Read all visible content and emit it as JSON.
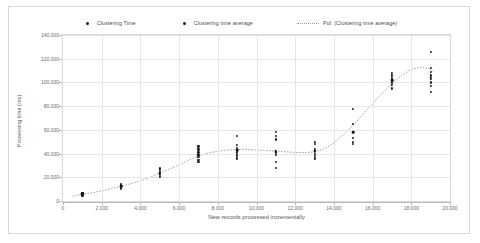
{
  "chart_data": {
    "type": "scatter",
    "title": "",
    "xlabel": "New records processed incrementally",
    "ylabel": "Processing time (ms)",
    "xlim": [
      0,
      20000
    ],
    "ylim": [
      0,
      140000
    ],
    "xticks": [
      0,
      2000,
      4000,
      6000,
      8000,
      10000,
      12000,
      14000,
      16000,
      18000,
      20000
    ],
    "xtick_labels": [
      "0",
      "2.000",
      "4.000",
      "6.000",
      "8.000",
      "10.000",
      "12.000",
      "14.000",
      "16.000",
      "18.000",
      "20.000"
    ],
    "yticks": [
      0,
      20000,
      40000,
      60000,
      80000,
      100000,
      120000,
      140000
    ],
    "ytick_labels": [
      "0",
      "20.000",
      "40.000",
      "60.000",
      "80.000",
      "100.000",
      "120.000",
      "140.000"
    ],
    "grid": true,
    "legend_position": "top",
    "legend": [
      {
        "name": "Clustering Time",
        "marker": "dot",
        "color": "#1f1f1f"
      },
      {
        "name": "Clustering time average",
        "marker": "dot",
        "color": "#111111"
      },
      {
        "name": "Pol. (Clustering time average)",
        "marker": "dotted-line",
        "color": "#9a9a9a"
      }
    ],
    "series": [
      {
        "name": "Clustering Time",
        "marker": "dot",
        "points": [
          {
            "x": 1000,
            "y": 4500
          },
          {
            "x": 1000,
            "y": 5200
          },
          {
            "x": 1000,
            "y": 5800
          },
          {
            "x": 1000,
            "y": 6400
          },
          {
            "x": 1000,
            "y": 7000
          },
          {
            "x": 3000,
            "y": 10500
          },
          {
            "x": 3000,
            "y": 11500
          },
          {
            "x": 3000,
            "y": 12500
          },
          {
            "x": 3000,
            "y": 13500
          },
          {
            "x": 3000,
            "y": 14500
          },
          {
            "x": 5000,
            "y": 20000
          },
          {
            "x": 5000,
            "y": 21500
          },
          {
            "x": 5000,
            "y": 23000
          },
          {
            "x": 5000,
            "y": 24500
          },
          {
            "x": 5000,
            "y": 26000
          },
          {
            "x": 5000,
            "y": 27500
          },
          {
            "x": 7000,
            "y": 33000
          },
          {
            "x": 7000,
            "y": 35000
          },
          {
            "x": 7000,
            "y": 37000
          },
          {
            "x": 7000,
            "y": 39000
          },
          {
            "x": 7000,
            "y": 41000
          },
          {
            "x": 7000,
            "y": 43500
          },
          {
            "x": 7000,
            "y": 46000
          },
          {
            "x": 9000,
            "y": 36000
          },
          {
            "x": 9000,
            "y": 38500
          },
          {
            "x": 9000,
            "y": 41000
          },
          {
            "x": 9000,
            "y": 43000
          },
          {
            "x": 9000,
            "y": 45000
          },
          {
            "x": 9000,
            "y": 47000
          },
          {
            "x": 9000,
            "y": 55000
          },
          {
            "x": 11000,
            "y": 28000
          },
          {
            "x": 11000,
            "y": 33000
          },
          {
            "x": 11000,
            "y": 39000
          },
          {
            "x": 11000,
            "y": 41000
          },
          {
            "x": 11000,
            "y": 52000
          },
          {
            "x": 11000,
            "y": 55000
          },
          {
            "x": 11000,
            "y": 58000
          },
          {
            "x": 13000,
            "y": 36000
          },
          {
            "x": 13000,
            "y": 38000
          },
          {
            "x": 13000,
            "y": 40000
          },
          {
            "x": 13000,
            "y": 42000
          },
          {
            "x": 13000,
            "y": 44000
          },
          {
            "x": 13000,
            "y": 48000
          },
          {
            "x": 13000,
            "y": 50000
          },
          {
            "x": 15000,
            "y": 48000
          },
          {
            "x": 15000,
            "y": 50000
          },
          {
            "x": 15000,
            "y": 53000
          },
          {
            "x": 15000,
            "y": 58000
          },
          {
            "x": 15000,
            "y": 65000
          },
          {
            "x": 15000,
            "y": 78000
          },
          {
            "x": 17000,
            "y": 95000
          },
          {
            "x": 17000,
            "y": 98000
          },
          {
            "x": 17000,
            "y": 100000
          },
          {
            "x": 17000,
            "y": 102000
          },
          {
            "x": 17000,
            "y": 104000
          },
          {
            "x": 17000,
            "y": 106000
          },
          {
            "x": 17000,
            "y": 108000
          },
          {
            "x": 19000,
            "y": 92000
          },
          {
            "x": 19000,
            "y": 97000
          },
          {
            "x": 19000,
            "y": 100000
          },
          {
            "x": 19000,
            "y": 103000
          },
          {
            "x": 19000,
            "y": 106000
          },
          {
            "x": 19000,
            "y": 109000
          },
          {
            "x": 19000,
            "y": 112000
          },
          {
            "x": 19000,
            "y": 126000
          }
        ]
      },
      {
        "name": "Clustering time average",
        "marker": "dot",
        "points": [
          {
            "x": 1000,
            "y": 5800
          },
          {
            "x": 3000,
            "y": 12500
          },
          {
            "x": 5000,
            "y": 23500
          },
          {
            "x": 7000,
            "y": 39000
          },
          {
            "x": 9000,
            "y": 43000
          },
          {
            "x": 11000,
            "y": 42000
          },
          {
            "x": 13000,
            "y": 42000
          },
          {
            "x": 15000,
            "y": 58000
          },
          {
            "x": 17000,
            "y": 102000
          },
          {
            "x": 19000,
            "y": 104000
          }
        ]
      }
    ],
    "trendline": {
      "name": "Pol. (Clustering time average)",
      "style": "dotted",
      "color": "#9a9a9a",
      "points": [
        {
          "x": 500,
          "y": 4200
        },
        {
          "x": 1000,
          "y": 5600
        },
        {
          "x": 1500,
          "y": 7000
        },
        {
          "x": 2000,
          "y": 8600
        },
        {
          "x": 2500,
          "y": 10400
        },
        {
          "x": 3000,
          "y": 12400
        },
        {
          "x": 3500,
          "y": 14600
        },
        {
          "x": 4000,
          "y": 17000
        },
        {
          "x": 4500,
          "y": 20000
        },
        {
          "x": 5000,
          "y": 23500
        },
        {
          "x": 5500,
          "y": 27000
        },
        {
          "x": 6000,
          "y": 30500
        },
        {
          "x": 6500,
          "y": 34500
        },
        {
          "x": 7000,
          "y": 38000
        },
        {
          "x": 7500,
          "y": 40500
        },
        {
          "x": 8000,
          "y": 42000
        },
        {
          "x": 8500,
          "y": 43000
        },
        {
          "x": 9000,
          "y": 43500
        },
        {
          "x": 9500,
          "y": 43500
        },
        {
          "x": 10000,
          "y": 43000
        },
        {
          "x": 10500,
          "y": 42500
        },
        {
          "x": 11000,
          "y": 42000
        },
        {
          "x": 11500,
          "y": 41500
        },
        {
          "x": 12000,
          "y": 41000
        },
        {
          "x": 12500,
          "y": 40800
        },
        {
          "x": 13000,
          "y": 41500
        },
        {
          "x": 13500,
          "y": 44000
        },
        {
          "x": 14000,
          "y": 49000
        },
        {
          "x": 14500,
          "y": 56000
        },
        {
          "x": 15000,
          "y": 64000
        },
        {
          "x": 15500,
          "y": 73000
        },
        {
          "x": 16000,
          "y": 82000
        },
        {
          "x": 16500,
          "y": 91000
        },
        {
          "x": 17000,
          "y": 99000
        },
        {
          "x": 17500,
          "y": 106000
        },
        {
          "x": 18000,
          "y": 111000
        },
        {
          "x": 18500,
          "y": 113000
        },
        {
          "x": 19000,
          "y": 111000
        },
        {
          "x": 19200,
          "y": 109000
        }
      ]
    }
  }
}
